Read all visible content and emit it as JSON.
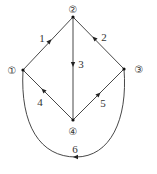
{
  "diagram": {
    "type": "directed-graph",
    "nodes": [
      {
        "id": "1",
        "label": "①",
        "x": 23,
        "y": 70,
        "lx": 12,
        "ly": 74
      },
      {
        "id": "2",
        "label": "②",
        "x": 73,
        "y": 17,
        "lx": 73,
        "ly": 13
      },
      {
        "id": "3",
        "label": "③",
        "x": 124,
        "y": 69,
        "lx": 139,
        "ly": 73
      },
      {
        "id": "4",
        "label": "④",
        "x": 73,
        "y": 120,
        "lx": 73,
        "ly": 135
      }
    ],
    "edges": [
      {
        "id": "e1",
        "label": "1",
        "from": "1",
        "to": "2"
      },
      {
        "id": "e2",
        "label": "2",
        "from": "3",
        "to": "2"
      },
      {
        "id": "e3",
        "label": "3",
        "from": "2",
        "to": "4"
      },
      {
        "id": "e4",
        "label": "4",
        "from": "4",
        "to": "1"
      },
      {
        "id": "e5",
        "label": "5",
        "from": "4",
        "to": "3"
      },
      {
        "id": "e6",
        "label": "6",
        "from": "3",
        "to": "1",
        "shape": "curve-below"
      }
    ]
  }
}
